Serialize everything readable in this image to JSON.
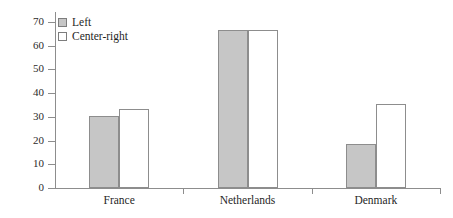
{
  "chart_data": {
    "type": "bar",
    "title": "",
    "subtitle": "",
    "xlabel": "",
    "ylabel": "",
    "categories": [
      "France",
      "Netherlands",
      "Denmark"
    ],
    "series": [
      {
        "name": "Left",
        "style": "gray-filled",
        "color": "#c6c6c6",
        "values": [
          30.5,
          66.5,
          18.5
        ]
      },
      {
        "name": "Center-right",
        "style": "white-hollow",
        "color": "#ffffff",
        "values": [
          33.5,
          66.5,
          35.5
        ]
      }
    ],
    "ylim": [
      0,
      70
    ],
    "yticks": [
      0,
      10,
      20,
      30,
      40,
      50,
      60,
      70
    ],
    "ytick_labels": [
      "0",
      "10",
      "20",
      "30",
      "40",
      "50",
      "60",
      "70"
    ],
    "grid": false,
    "legend_position": "top-left",
    "annotations": []
  },
  "legend": {
    "items": [
      {
        "label": "Left",
        "swatch": "filled"
      },
      {
        "label": "Center-right",
        "swatch": "empty"
      }
    ]
  },
  "colors": {
    "bar_fill_left": "#c6c6c6",
    "bar_fill_right": "#ffffff",
    "bar_stroke": "#8d8d8d",
    "axis": "#8d8d8d",
    "text": "#1f1f1f",
    "background": "#ffffff"
  }
}
